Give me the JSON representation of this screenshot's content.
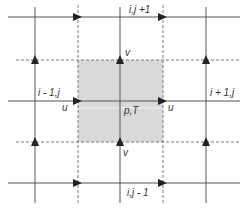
{
  "diagram": {
    "colors": {
      "background": "#ffffff",
      "line": "#555555",
      "dashed": "#777777",
      "cell_fill": "#d9d9d9",
      "arrow": "#222222",
      "text": "#333333"
    },
    "labels": {
      "top_node": "i,j +1",
      "left_node": "i - 1,j",
      "right_node": "i + 1,j",
      "bottom_node": "i,j - 1",
      "center": "p,T",
      "u_left": "u",
      "u_right": "u",
      "v_top": "v",
      "v_bottom": "v"
    },
    "grid": {
      "solid_x": [
        35,
        120,
        206
      ],
      "solid_y": [
        17,
        101,
        183
      ],
      "dashed_x": [
        78,
        163
      ],
      "dashed_y": [
        60,
        142
      ],
      "control_volume": {
        "x": 78,
        "y": 60,
        "w": 85,
        "h": 82
      }
    }
  }
}
